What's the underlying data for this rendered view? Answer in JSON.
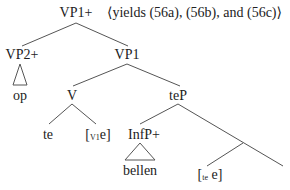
{
  "diagram": {
    "type": "syntax-tree",
    "root": {
      "label": "VP1+",
      "annotation": "⟨yields (56a), (56b), and (56c)⟩"
    },
    "nodes": {
      "vp2plus": {
        "label": "VP2+",
        "triangle_leaf": "op"
      },
      "vp1": {
        "label": "VP1"
      },
      "v": {
        "label": "V"
      },
      "te": {
        "label": "te"
      },
      "v1e": {
        "open": "[",
        "sub": "V1",
        "text": "e]"
      },
      "tep": {
        "label": "teP"
      },
      "infpplus": {
        "label": "InfP+",
        "triangle_leaf": "bellen"
      },
      "tee": {
        "open": "[",
        "sub": "te",
        "text": " e]"
      }
    },
    "line_color": "#555555"
  }
}
